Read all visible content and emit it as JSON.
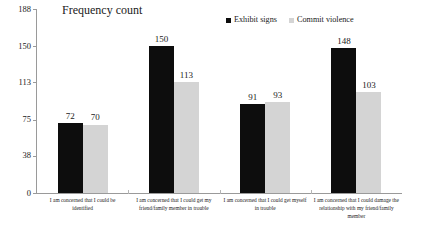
{
  "chart": {
    "title": "Frequency count",
    "legend": [
      {
        "label": "Exhibit signs",
        "color": "#0d0d0d"
      },
      {
        "label": "Commit violence",
        "color": "#d4d4d4"
      }
    ],
    "y_ticks": [
      "188",
      "150",
      "113",
      "75",
      "38",
      "0"
    ]
  },
  "chart_data": {
    "type": "bar",
    "title": "Frequency count",
    "xlabel": "",
    "ylabel": "",
    "ylim": [
      0,
      188
    ],
    "yticks": [
      0,
      38,
      75,
      113,
      150,
      188
    ],
    "grid": false,
    "legend_position": "top-center",
    "categories": [
      "I am  concerned that I could be identified",
      "I am concerned that I could  get my friend/family member in trouble",
      "I am concerned that I could get myself in trouble",
      "I am concerned that I could damage the relationship with my friend/family member"
    ],
    "category_lines": [
      [
        "I am  concerned that I could be",
        "identified"
      ],
      [
        "I am concerned that I could  get my",
        "friend/family member in trouble"
      ],
      [
        "I am concerned that I could get myself",
        "in trouble"
      ],
      [
        "I am concerned that I could damage the",
        "relationship with my friend/family",
        "member"
      ]
    ],
    "series": [
      {
        "name": "Exhibit signs",
        "color": "#0d0d0d",
        "values": [
          72,
          150,
          91,
          148
        ]
      },
      {
        "name": "Commit violence",
        "color": "#d4d4d4",
        "values": [
          70,
          113,
          93,
          103
        ]
      }
    ]
  }
}
